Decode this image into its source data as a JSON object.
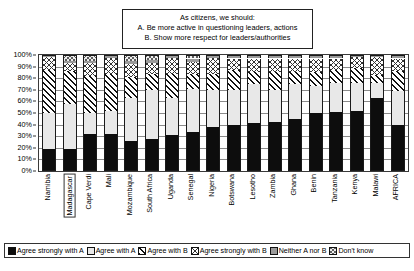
{
  "title": {
    "lines": [
      "As citizens, we should:",
      "A. Be more active in questioning leaders, actions",
      "B. Show more respect for leaders/authorities"
    ]
  },
  "axis": {
    "y_ticks": [
      "100%",
      "90%",
      "80%",
      "70%",
      "60%",
      "50%",
      "40%",
      "30%",
      "20%",
      "10%",
      "0%"
    ]
  },
  "highlight": {
    "category": "Madagascar"
  },
  "legend": {
    "items": [
      {
        "label": "Agree strongly with A",
        "swatch": "solid-black"
      },
      {
        "label": "Agree with A",
        "swatch": "light-gray"
      },
      {
        "label": "Agree with B",
        "swatch": "diagonal-hatch"
      },
      {
        "label": "Agree strongly with B",
        "swatch": "cross-hatch"
      },
      {
        "label": "Neither A nor B",
        "swatch": "mid-gray"
      },
      {
        "label": "Don't know",
        "swatch": "dark-cross-hatch"
      }
    ]
  },
  "chart_data": {
    "type": "bar",
    "stacked": true,
    "stack_total": 100,
    "title": "As citizens, we should: A. Be more active in questioning leaders, actions  B. Show more respect for leaders/authorities",
    "xlabel": "",
    "ylabel": "",
    "ylim": [
      0,
      100
    ],
    "ytick_step": 10,
    "grid": true,
    "legend_position": "bottom",
    "categories": [
      "Namibia",
      "Madagascar",
      "Cape Verdi",
      "Mali",
      "Mozambique",
      "South Africa",
      "Uganda",
      "Senegal",
      "Nigeria",
      "Botswana",
      "Lesotho",
      "Zambia",
      "Ghana",
      "Benin",
      "Tanzania",
      "Kenya",
      "Malawi",
      "AFRICA"
    ],
    "series": [
      {
        "name": "Agree strongly with A",
        "values": [
          19,
          19,
          32,
          32,
          26,
          28,
          31,
          34,
          38,
          40,
          41,
          42,
          45,
          50,
          51,
          52,
          63,
          40
        ]
      },
      {
        "name": "Agree with A",
        "values": [
          31,
          39,
          18,
          20,
          37,
          42,
          32,
          37,
          32,
          30,
          34,
          28,
          30,
          23,
          25,
          24,
          13,
          29
        ]
      },
      {
        "name": "Agree with B",
        "values": [
          37,
          28,
          32,
          32,
          18,
          14,
          21,
          13,
          14,
          17,
          10,
          15,
          10,
          12,
          11,
          13,
          7,
          17
        ]
      },
      {
        "name": "Agree strongly with B",
        "values": [
          11,
          7,
          11,
          13,
          11,
          9,
          13,
          10,
          13,
          10,
          12,
          12,
          12,
          12,
          10,
          9,
          15,
          11
        ]
      },
      {
        "name": "Neither A nor B",
        "values": [
          1,
          2,
          2,
          2,
          3,
          3,
          2,
          3,
          2,
          2,
          2,
          2,
          2,
          2,
          2,
          1,
          1,
          2
        ]
      },
      {
        "name": "Don't know",
        "values": [
          1,
          5,
          5,
          1,
          5,
          4,
          1,
          3,
          1,
          1,
          1,
          1,
          1,
          1,
          1,
          1,
          1,
          1
        ]
      }
    ]
  }
}
